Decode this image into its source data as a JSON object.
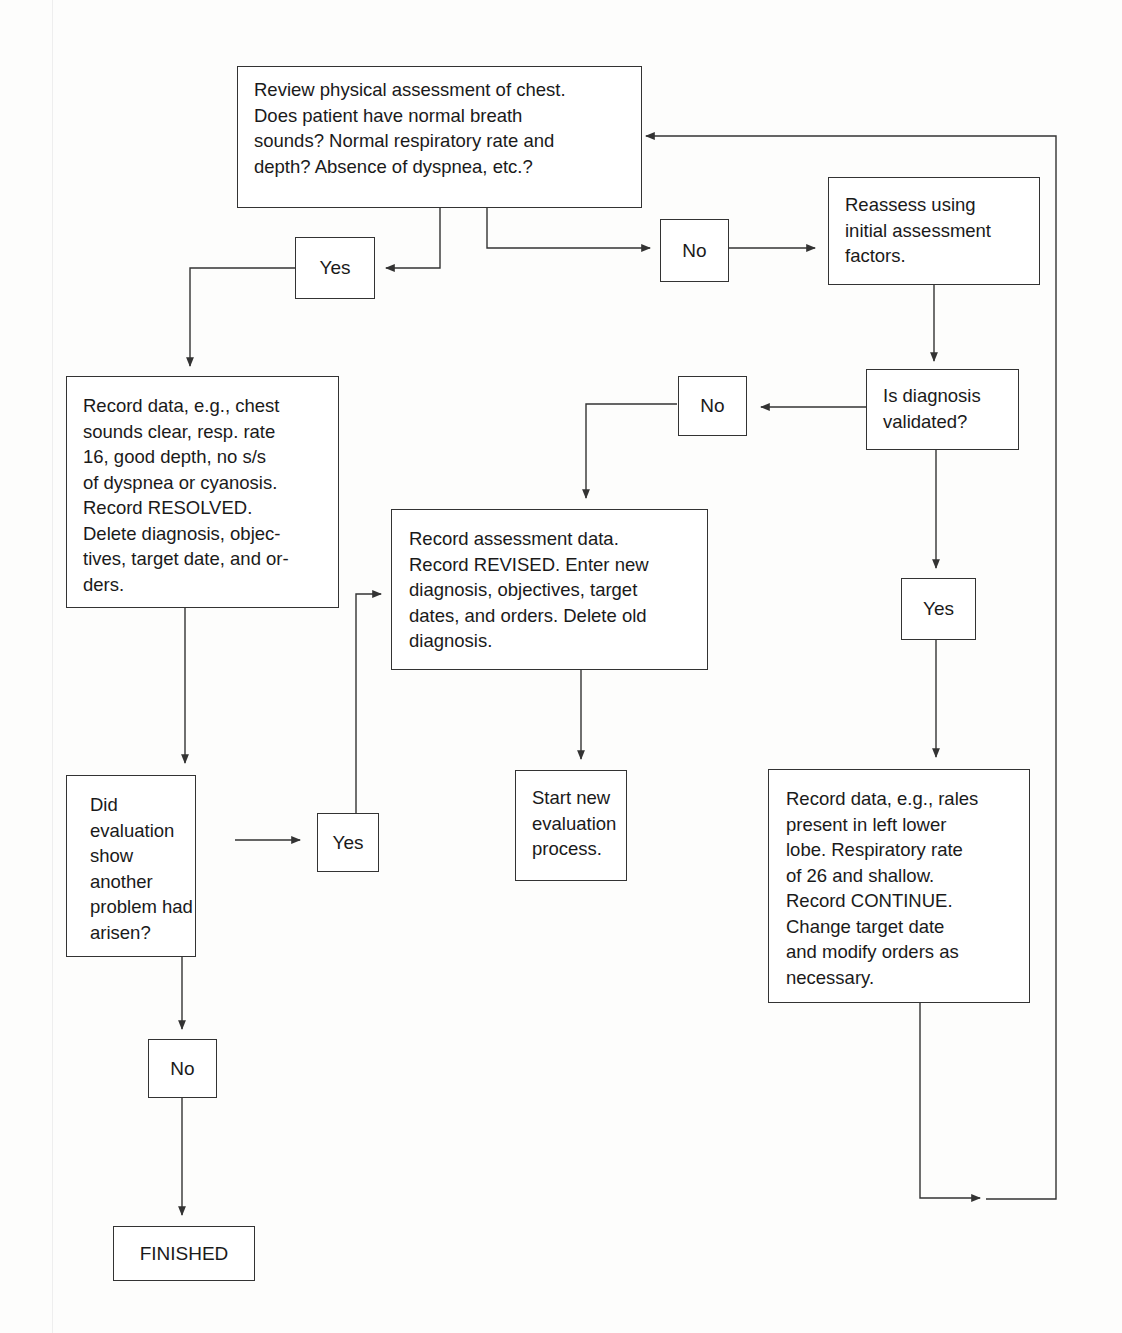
{
  "diagram": {
    "type": "flowchart",
    "nodes": {
      "review": "Review physical assessment of chest.\nDoes patient have normal breath\nsounds? Normal respiratory rate and\ndepth? Absence of dyspnea, etc.?",
      "yes_top": "Yes",
      "no_top": "No",
      "reassess": "Reassess using\ninitial assessment\nfactors.",
      "validated": "Is diagnosis\nvalidated?",
      "no_validated": "No",
      "yes_validated": "Yes",
      "resolved": "Record data, e.g., chest\nsounds clear, resp. rate\n16, good depth, no s/s\nof dyspnea or cyanosis.\nRecord RESOLVED.\nDelete diagnosis, objec-\ntives, target date, and or-\nders.",
      "revised": "Record assessment data.\nRecord REVISED. Enter new\ndiagnosis, objectives, target\ndates, and orders. Delete old\ndiagnosis.",
      "another_problem": "Did\nevaluation\nshow\nanother\nproblem had\narisen?",
      "yes_problem": "Yes",
      "start_new": "Start new\nevaluation\nprocess.",
      "continue": "Record data, e.g., rales\npresent in left lower\nlobe. Respiratory rate\nof 26 and shallow.\nRecord CONTINUE.\nChange target date\nand modify orders as\nnecessary.",
      "no_problem": "No",
      "finished": "FINISHED"
    },
    "edges": [
      {
        "from": "review",
        "to": "yes_top"
      },
      {
        "from": "review",
        "to": "no_top"
      },
      {
        "from": "no_top",
        "to": "reassess"
      },
      {
        "from": "yes_top",
        "to": "resolved"
      },
      {
        "from": "reassess",
        "to": "validated"
      },
      {
        "from": "validated",
        "to": "no_validated"
      },
      {
        "from": "no_validated",
        "to": "revised"
      },
      {
        "from": "validated",
        "to": "yes_validated"
      },
      {
        "from": "yes_validated",
        "to": "continue"
      },
      {
        "from": "continue",
        "to": "review"
      },
      {
        "from": "resolved",
        "to": "another_problem"
      },
      {
        "from": "another_problem",
        "to": "yes_problem"
      },
      {
        "from": "yes_problem",
        "to": "revised"
      },
      {
        "from": "revised",
        "to": "start_new"
      },
      {
        "from": "another_problem",
        "to": "no_problem"
      },
      {
        "from": "no_problem",
        "to": "finished"
      }
    ],
    "colors": {
      "line": "#333333",
      "background": "#fdfdfc",
      "text": "#1a1a1a"
    }
  }
}
